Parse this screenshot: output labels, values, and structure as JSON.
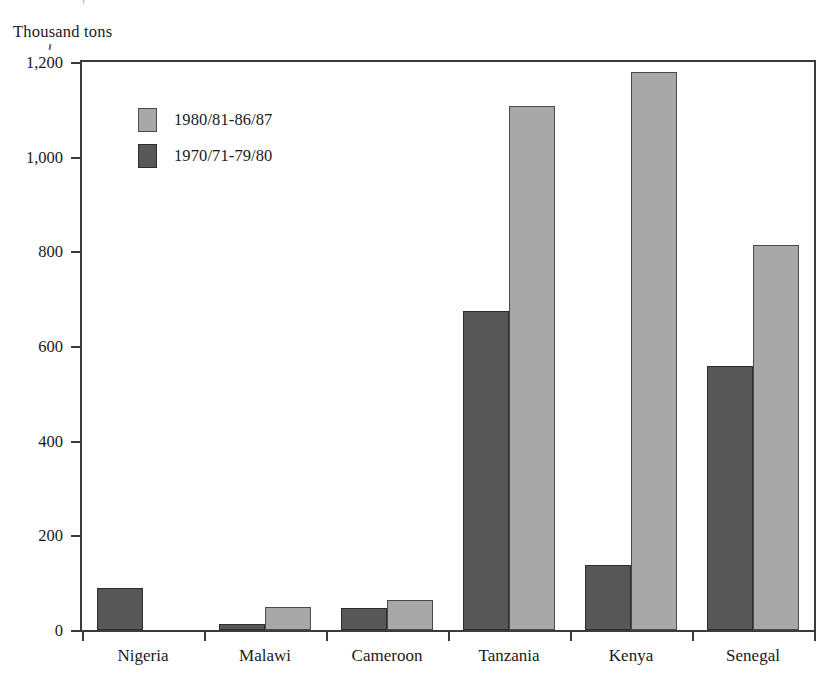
{
  "chart_data": {
    "type": "bar",
    "title": "",
    "subtitle": "",
    "xlabel": "",
    "ylabel": "Thousand tons",
    "ylim": [
      0,
      1200
    ],
    "ytick_labels": [
      "0",
      "200",
      "400",
      "600",
      "800",
      "1,000",
      "1,200"
    ],
    "ytick_values": [
      0,
      200,
      400,
      600,
      800,
      1000,
      1200
    ],
    "grid": false,
    "legend_position": "top-left-inside",
    "categories": [
      "Nigeria",
      "Malawi",
      "Cameroon",
      "Tanzania",
      "Kenya",
      "Senegal"
    ],
    "series": [
      {
        "name": "1970/71-79/80",
        "color": "#575757",
        "values": [
          88,
          12,
          46,
          673,
          138,
          558
        ]
      },
      {
        "name": "1980/81-86/87",
        "color": "#a8a8a8",
        "values": [
          0,
          48,
          63,
          1108,
          1178,
          813
        ]
      }
    ],
    "legend": [
      {
        "label": "1980/81-86/87",
        "swatch": "light"
      },
      {
        "label": "1970/71-79/80",
        "swatch": "dark"
      }
    ],
    "annotations": []
  },
  "artifact": {
    "mark": "'"
  }
}
